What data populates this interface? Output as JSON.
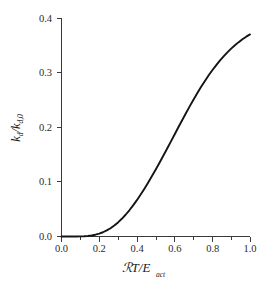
{
  "chart_data": {
    "type": "line",
    "title": "",
    "subtitle": "",
    "xlabel": "RT/E",
    "xlabel_script_char": "ℛ",
    "xlabel_main": "T/E",
    "xlabel_subscript": "act",
    "ylabel_main": "k",
    "ylabel_sub1": "d",
    "ylabel_mid": "/k",
    "ylabel_sub2": "d,0",
    "ylabel": "k_d/k_d,0",
    "xlim": [
      0.0,
      1.0
    ],
    "ylim": [
      0.0,
      0.4
    ],
    "grid": false,
    "legend": null,
    "x_major_ticks": [
      "0.0",
      "0.2",
      "0.4",
      "0.6",
      "0.8",
      "1.0"
    ],
    "x_major_values": [
      0.0,
      0.2,
      0.4,
      0.6,
      0.8,
      1.0
    ],
    "x_minor_values": [
      0.1,
      0.3,
      0.5,
      0.7,
      0.9
    ],
    "y_major_ticks": [
      "0.0",
      "0.1",
      "0.2",
      "0.3",
      "0.4"
    ],
    "y_major_values": [
      0.0,
      0.1,
      0.2,
      0.3,
      0.4
    ],
    "series": [
      {
        "name": "k_d/k_d,0",
        "color": "#141414",
        "x": [
          0.0,
          0.02,
          0.04,
          0.06,
          0.08,
          0.1,
          0.12,
          0.14,
          0.16,
          0.18,
          0.2,
          0.22,
          0.24,
          0.26,
          0.28,
          0.3,
          0.32,
          0.34,
          0.36,
          0.38,
          0.4,
          0.42,
          0.44,
          0.46,
          0.48,
          0.5,
          0.52,
          0.54,
          0.56,
          0.58,
          0.6,
          0.62,
          0.64,
          0.66,
          0.68,
          0.7,
          0.72,
          0.74,
          0.76,
          0.78,
          0.8,
          0.82,
          0.84,
          0.86,
          0.88,
          0.9,
          0.92,
          0.94,
          0.96,
          0.98,
          1.0
        ],
        "y": [
          0.0,
          0.0,
          0.0,
          0.0,
          0.0001,
          0.0002,
          0.0005,
          0.001,
          0.0019,
          0.0033,
          0.0052,
          0.0078,
          0.0111,
          0.0152,
          0.0201,
          0.0258,
          0.0324,
          0.0398,
          0.048,
          0.0569,
          0.0665,
          0.0768,
          0.0876,
          0.0989,
          0.1106,
          0.1227,
          0.1351,
          0.1478,
          0.1607,
          0.1737,
          0.1868,
          0.1999,
          0.2129,
          0.2257,
          0.2382,
          0.2504,
          0.2622,
          0.2735,
          0.2843,
          0.2946,
          0.3043,
          0.3134,
          0.3219,
          0.3298,
          0.3371,
          0.3439,
          0.3501,
          0.3558,
          0.361,
          0.3658,
          0.37
        ]
      }
    ]
  },
  "axes": {
    "x_title_parts": {
      "script_r": "ℛ",
      "main": "T/E",
      "subscript": "act"
    },
    "y_title_parts": {
      "k": "k",
      "sub_d": "d",
      "slash_k": "/k",
      "sub_d0": "d,0"
    }
  }
}
